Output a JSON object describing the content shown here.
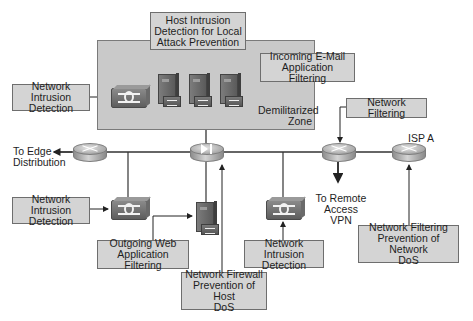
{
  "diagram": {
    "zones": {
      "dmz_label": "Demilitarized Zone",
      "dmz_label_line1": "Demilitarized",
      "dmz_label_line2": "Zone"
    },
    "callouts": {
      "host_intrusion": {
        "line1": "Host Intrusion",
        "line2": "Detection for Local",
        "line3": "Attack Prevention"
      },
      "nids_dmz": {
        "line1": "Network Intrusion",
        "line2": "Detection"
      },
      "incoming_email": {
        "line1": "Incoming E-Mail",
        "line2": "Application Filtering"
      },
      "network_filtering": {
        "line1": "Network Filtering"
      },
      "nids_left": {
        "line1": "Network Intrusion",
        "line2": "Detection"
      },
      "outgoing_web": {
        "line1": "Outgoing Web",
        "line2": "Application Filtering"
      },
      "nids_right": {
        "line1": "Network Intrusion",
        "line2": "Detection"
      },
      "firewall_dos": {
        "line1": "Network Firewall",
        "line2": "Prevention of Host",
        "line3": "DoS"
      },
      "network_filtering_dos": {
        "line1": "Network Filtering",
        "line2": "Prevention of Network",
        "line3": "DoS"
      }
    },
    "endpoints": {
      "edge": {
        "line1": "To Edge",
        "line2": "Distribution"
      },
      "remote_vpn": {
        "line1": "To Remote",
        "line2": "Access VPN"
      },
      "isp": {
        "label": "ISP A"
      }
    },
    "devices": [
      {
        "id": "dmz-ids",
        "type": "network-ids-appliance"
      },
      {
        "id": "dmz-server-1",
        "type": "server-with-hids"
      },
      {
        "id": "dmz-server-2",
        "type": "server-with-hids"
      },
      {
        "id": "dmz-server-3",
        "type": "server-with-hids"
      },
      {
        "id": "edge-router",
        "type": "router"
      },
      {
        "id": "firewall-router",
        "type": "firewall-router"
      },
      {
        "id": "vpn-router",
        "type": "router"
      },
      {
        "id": "isp-router",
        "type": "router"
      },
      {
        "id": "left-ids",
        "type": "network-ids-appliance"
      },
      {
        "id": "web-proxy-server",
        "type": "server-with-filter"
      },
      {
        "id": "right-ids",
        "type": "network-ids-appliance"
      }
    ],
    "colors": {
      "callout_fill": "#d4d4d4",
      "callout_border": "#6e6e6e",
      "dmz_fill": "#c9c9c9",
      "line": "#333333"
    }
  }
}
